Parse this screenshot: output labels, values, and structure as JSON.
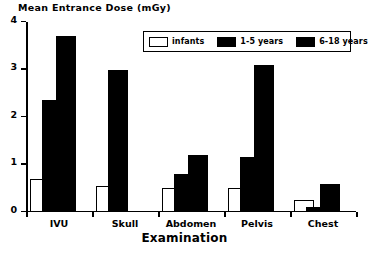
{
  "chart_data": {
    "type": "bar",
    "title": "Mean Entrance Dose (mGy)",
    "xlabel": "Examination",
    "ylabel": "Mean Entrance Dose (mGy)",
    "ylim": [
      0,
      4
    ],
    "yticks": [
      "0",
      "1",
      "2",
      "3",
      "4"
    ],
    "grid": false,
    "legend_position": "top-right-inside",
    "categories": [
      "IVU",
      "Skull",
      "Abdomen",
      "Pelvis",
      "Chest"
    ],
    "series": [
      {
        "name": "infants",
        "color": "#ffffff",
        "values": [
          0.7,
          0.55,
          0.5,
          0.5,
          0.25
        ]
      },
      {
        "name": "1-5 years",
        "color": "#000000",
        "values": [
          2.35,
          3.0,
          0.8,
          1.15,
          0.1
        ]
      },
      {
        "name": "6-18 years",
        "color": "#000000",
        "values": [
          3.7,
          0.0,
          1.2,
          3.1,
          0.6
        ]
      }
    ]
  },
  "legend": {
    "items": [
      {
        "label": "infants",
        "swatch": "white"
      },
      {
        "label": "1-5 years",
        "swatch": "black"
      },
      {
        "label": "6-18 years",
        "swatch": "black"
      }
    ]
  }
}
